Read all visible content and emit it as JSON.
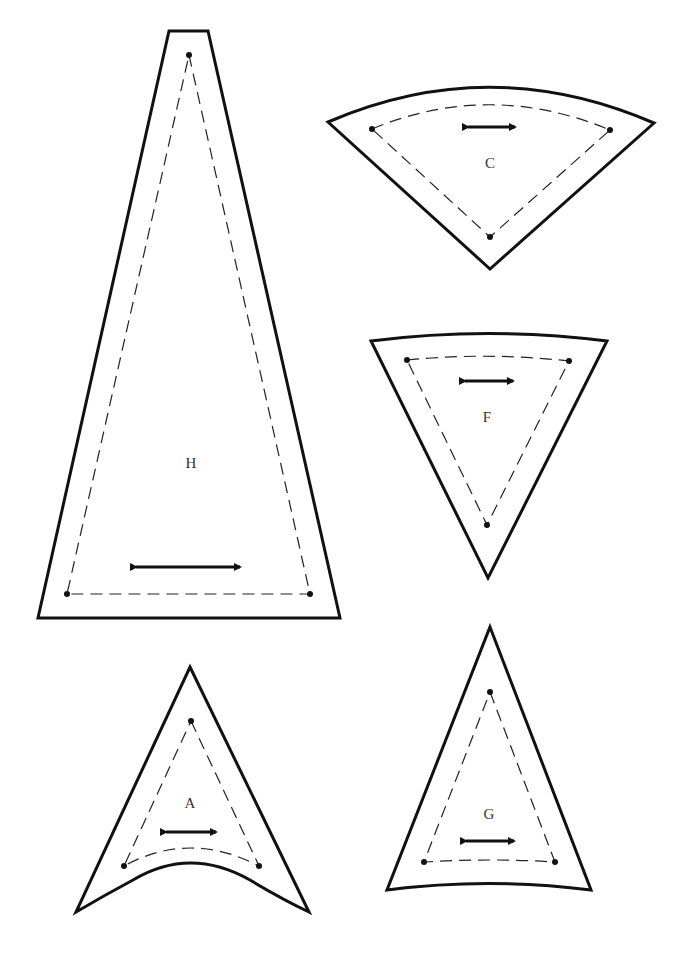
{
  "diagram": {
    "type": "sewing-pattern-pieces",
    "colors": {
      "cut_line": "#111111",
      "seam_line": "#222222",
      "label": "#333333",
      "background": "#ffffff"
    },
    "pieces": [
      {
        "id": "H",
        "label": "H",
        "shape": "tall trapezoid",
        "grainline": "horizontal"
      },
      {
        "id": "C",
        "label": "C",
        "shape": "wedge / fan segment, curved top",
        "grainline": "horizontal"
      },
      {
        "id": "F",
        "label": "F",
        "shape": "inverted triangle, slightly curved top",
        "grainline": "horizontal"
      },
      {
        "id": "A",
        "label": "A",
        "shape": "arrowhead triangle, concave curved base",
        "grainline": "horizontal"
      },
      {
        "id": "G",
        "label": "G",
        "shape": "tall triangle, slightly concave base",
        "grainline": "horizontal"
      }
    ],
    "legend": {
      "solid_line": "cutting line",
      "dashed_line": "seam line",
      "dots": "seam corner markers",
      "double_arrow": "grainline"
    }
  }
}
